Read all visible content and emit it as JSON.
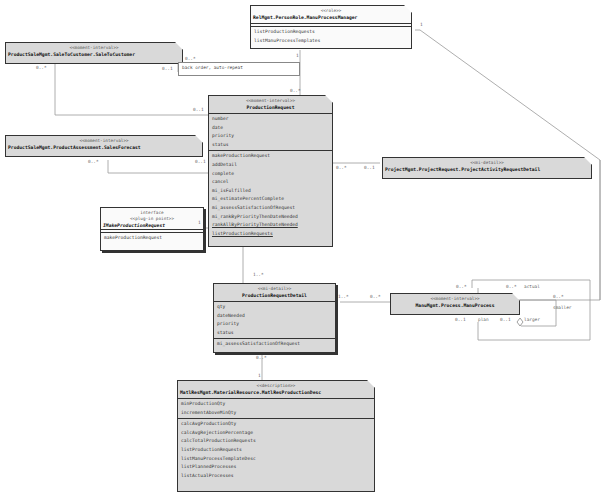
{
  "classes": {
    "manu_process_manager": {
      "stereotype": "<<role>>",
      "name": "RelMgmt.PersonRole.ManuProcessManager",
      "methods": [
        "listProductionRequests",
        "listManuProcessTemplates"
      ]
    },
    "sale_to_customer": {
      "stereotype": "<<moment-interval>>",
      "name": "ProductSaleMgmt.SaleToCustomer.SaleToCustomer"
    },
    "production_request": {
      "stereotype": "<<moment-interval>>",
      "name": "ProductionRequest",
      "attributes": [
        "number",
        "date",
        "priority",
        "status"
      ],
      "methods": [
        "makeProductionRequest",
        "addDetail",
        "complete",
        "cancel",
        "mi_isFulfilled",
        "mi_estimatePercentComplete",
        "mi_assessSatisfactionOfRequest",
        "mi_rankByPriorityThenDateNeeded"
      ],
      "static_methods": [
        "rankAllByPriorityThenDateNeeded",
        "listProductionRequests"
      ]
    },
    "sales_forecast": {
      "stereotype": "<<moment-interval>>",
      "name": "ProductSaleMgmt.ProductAssessment.SalesForecast"
    },
    "make_production_request": {
      "stereotype1": "interface",
      "stereotype2": "<<plug-in point>>",
      "name": "IMakeProductionRequest",
      "methods": [
        "makeProductionRequest"
      ]
    },
    "project_activity_request_detail": {
      "stereotype": "<<mi-detail>>",
      "name": "ProjectMgmt.ProjectRequest.ProjectActivityRequestDetail"
    },
    "production_request_detail": {
      "stereotype": "<<mi-detail>>",
      "name": "ProductionRequestDetail",
      "attributes": [
        "qty",
        "dateNeeded",
        "priority",
        "status"
      ],
      "methods": [
        "mi_assessSatisfactionOfRequest"
      ]
    },
    "manu_process": {
      "stereotype": "<<moment-interval>>",
      "name": "ManuMgmt.Process.ManuProcess"
    },
    "matl_res_production_desc": {
      "stereotype": "<<description>>",
      "name": "MatlResMgmt.MaterialResource.MatlResProductionDesc",
      "attributes": [
        "minProductionQty",
        "incrementAboveMinQty"
      ],
      "methods": [
        "calcAvgProductionQty",
        "calcAvgRejectionPercentage",
        "calcTotalProductionRequests",
        "listProductionRequests",
        "listManuProcessTemplateDesc",
        "listPlannedProcesses",
        "listActualProcesses"
      ]
    }
  },
  "notes": {
    "back_order": "back order, auto-repeat"
  },
  "multiplicities": {
    "mgr_right": "1",
    "mgr_down": "1",
    "pr_top": "0..*",
    "stc_right": "0..*",
    "stc_left": "0..*",
    "stc_note": "0..1",
    "pr_left_stc": "0..1",
    "sf_left": "0..*",
    "sf_right": "0..1",
    "iface": "1",
    "pard_left_1": "0..*",
    "pard_left_2": "0..1",
    "pr_bottom": "1..*",
    "prd_right": "1..*",
    "mp_left": "0..*",
    "mp_top_1": "0..*",
    "mp_top_2": "0..*",
    "actual": "actual",
    "mp_right": "0..*",
    "smaller": "smaller",
    "mp_plan_mult": "0..1",
    "plan": "plan",
    "mp_larger_mult": "0..1",
    "larger": "larger",
    "prd_bottom": "0..*",
    "desc_top": "1"
  }
}
